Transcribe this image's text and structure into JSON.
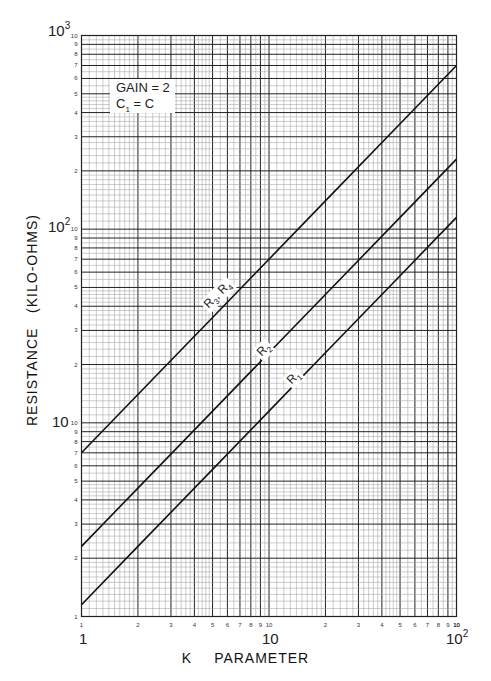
{
  "chart_data": {
    "type": "line",
    "title": "",
    "xlabel": "K PARAMETER",
    "ylabel": "RESISTANCE (KILO-OHMS)",
    "xscale": "log",
    "yscale": "log",
    "xlim": [
      1,
      100
    ],
    "ylim": [
      1,
      1000
    ],
    "grid": true,
    "x_decade_labels": [
      "1",
      "10",
      "10^2"
    ],
    "y_decade_labels": [
      "10",
      "10^2",
      "10^3"
    ],
    "x_minor_tick_labels": [
      "1",
      "2",
      "3",
      "4",
      "5",
      "6",
      "7",
      "8",
      "9",
      "10"
    ],
    "y_minor_tick_labels": [
      "1",
      "2",
      "3",
      "4",
      "5",
      "6",
      "7",
      "8",
      "9",
      "10"
    ],
    "annotation": {
      "line1": "GAIN = 2",
      "line2_main": "C",
      "line2_sub": "1",
      "line2_rest": " = C"
    },
    "series": [
      {
        "name": "R3, R4",
        "label_main": [
          "R",
          "3",
          ", R",
          "4"
        ],
        "x": [
          1,
          2,
          5,
          10,
          20,
          50,
          100
        ],
        "y": [
          7,
          14,
          35,
          70,
          140,
          350,
          700
        ]
      },
      {
        "name": "R2",
        "label_main": [
          "R",
          "2"
        ],
        "x": [
          1,
          2,
          5,
          10,
          20,
          50,
          100
        ],
        "y": [
          2.3,
          4.6,
          11.5,
          23,
          46,
          115,
          230
        ]
      },
      {
        "name": "R1",
        "label_main": [
          "R",
          "1"
        ],
        "x": [
          1,
          2,
          5,
          10,
          20,
          50,
          100
        ],
        "y": [
          1.15,
          2.3,
          5.75,
          11.5,
          23,
          57.5,
          115
        ]
      }
    ]
  },
  "labels": {
    "x_title_k": "K",
    "x_title_param": "PARAMETER",
    "y_title": "RESISTANCE   (KILO-OHMS)",
    "x_dec_1": "1",
    "x_dec_10": "10",
    "x_dec_100_base": "10",
    "x_dec_100_exp": "2",
    "y_dec_10": "10",
    "y_dec_100_base": "10",
    "y_dec_100_exp": "2",
    "y_dec_1000_base": "10",
    "y_dec_1000_exp": "3",
    "legend_line1": "GAIN = 2",
    "legend_c": "C",
    "legend_c_sub": "1",
    "legend_rest": " = C",
    "curve_r34_a": "R",
    "curve_r34_a_sub": "3",
    "curve_r34_b": ", R",
    "curve_r34_b_sub": "4",
    "curve_r2": "R",
    "curve_r2_sub": "2",
    "curve_r1": "R",
    "curve_r1_sub": "1"
  },
  "colors": {
    "grid_major": "#222222",
    "grid_minor": "#9a9a9a",
    "curve": "#111111",
    "background": "#ffffff"
  }
}
